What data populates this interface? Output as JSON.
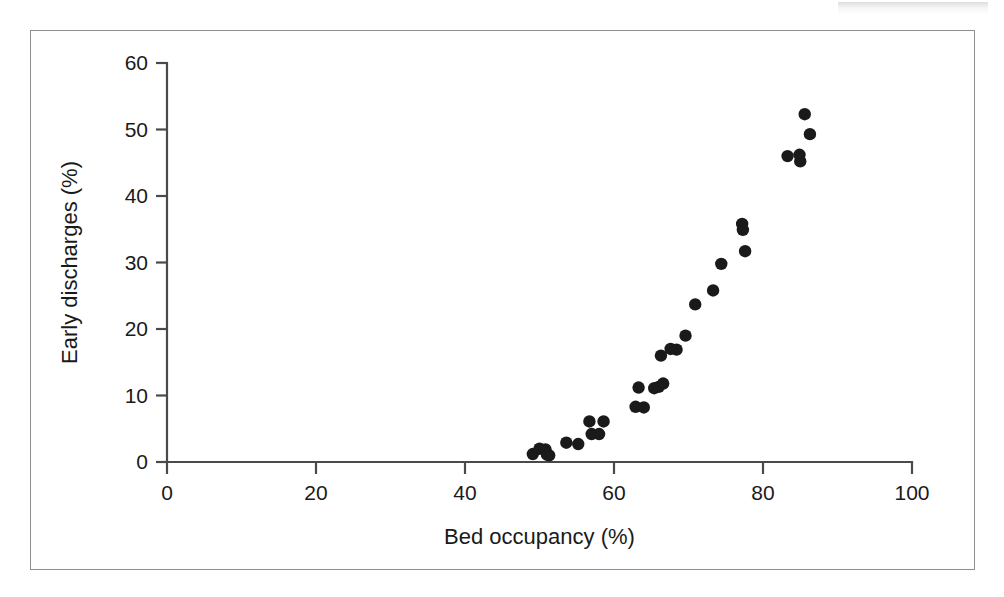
{
  "figure": {
    "frame_color": "#8e8e8e",
    "background_color": "#ffffff",
    "marker_color": "#1a1a1a",
    "axis_color": "#4a4a4a"
  },
  "artifact": {
    "name": "scan-edge-artifact"
  },
  "chart_data": {
    "type": "scatter",
    "title": "",
    "subtitle": "",
    "xlabel": "Bed occupancy (%)",
    "ylabel": "Early discharges (%)",
    "xlim": [
      0,
      100
    ],
    "ylim": [
      0,
      60
    ],
    "xticks": [
      0,
      20,
      40,
      60,
      80,
      100
    ],
    "yticks": [
      0,
      10,
      20,
      30,
      40,
      50,
      60
    ],
    "xtick_labels": [
      "0",
      "20",
      "40",
      "60",
      "80",
      "100"
    ],
    "ytick_labels": [
      "0",
      "10",
      "20",
      "30",
      "40",
      "50",
      "60"
    ],
    "grid": false,
    "legend": null,
    "legend_position": "none",
    "annotations": [],
    "marker": "filled-circle",
    "n_points": 35,
    "points": [
      {
        "x": 49.1,
        "y": 1.2
      },
      {
        "x": 50.0,
        "y": 2.0
      },
      {
        "x": 50.8,
        "y": 1.9
      },
      {
        "x": 51.0,
        "y": 1.1
      },
      {
        "x": 51.3,
        "y": 1.0
      },
      {
        "x": 53.6,
        "y": 2.9
      },
      {
        "x": 55.2,
        "y": 2.7
      },
      {
        "x": 56.7,
        "y": 6.1
      },
      {
        "x": 57.0,
        "y": 4.2
      },
      {
        "x": 58.0,
        "y": 4.2
      },
      {
        "x": 58.6,
        "y": 6.1
      },
      {
        "x": 62.9,
        "y": 8.3
      },
      {
        "x": 63.3,
        "y": 11.2
      },
      {
        "x": 64.0,
        "y": 8.2
      },
      {
        "x": 65.4,
        "y": 11.1
      },
      {
        "x": 66.0,
        "y": 11.3
      },
      {
        "x": 66.3,
        "y": 16.0
      },
      {
        "x": 66.6,
        "y": 11.8
      },
      {
        "x": 67.6,
        "y": 17.0
      },
      {
        "x": 68.4,
        "y": 16.9
      },
      {
        "x": 69.6,
        "y": 19.0
      },
      {
        "x": 70.9,
        "y": 23.7
      },
      {
        "x": 73.3,
        "y": 25.8
      },
      {
        "x": 74.4,
        "y": 29.8
      },
      {
        "x": 77.2,
        "y": 35.8
      },
      {
        "x": 77.3,
        "y": 34.9
      },
      {
        "x": 77.6,
        "y": 31.7
      },
      {
        "x": 83.3,
        "y": 46.0
      },
      {
        "x": 84.9,
        "y": 46.2
      },
      {
        "x": 85.0,
        "y": 45.2
      },
      {
        "x": 85.6,
        "y": 52.3
      },
      {
        "x": 86.3,
        "y": 49.3
      }
    ]
  }
}
